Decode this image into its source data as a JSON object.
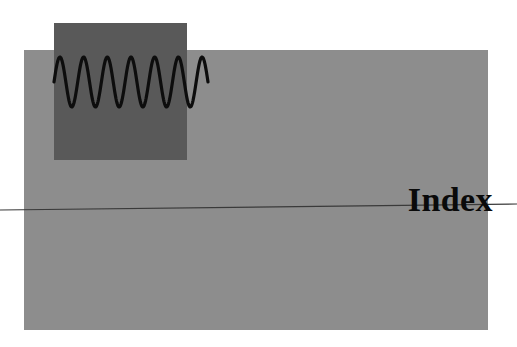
{
  "page": {
    "width": 517,
    "height": 347,
    "background_color": "#ffffff"
  },
  "heading": {
    "text": "Index",
    "color": "#0a0a0a",
    "style": "bold-serif",
    "font_size_px": 34
  },
  "shapes": {
    "background_band": {
      "name": "light-gray-band",
      "color": "#8d8d8d",
      "x": 24,
      "y": 50,
      "width": 464,
      "height": 280
    },
    "overlay_panel": {
      "name": "dark-gray-panel",
      "color": "#595959",
      "x": 54,
      "y": 23,
      "width": 133,
      "height": 137
    },
    "horizontal_rule": {
      "name": "tilted-rule",
      "color": "#3a3a3a",
      "x1": 0,
      "y1": 210,
      "x2": 517,
      "y2": 204,
      "stroke_width": 1.2
    }
  },
  "chart_data": {
    "type": "line",
    "title": "",
    "subtitle": "",
    "xlabel": "",
    "ylabel": "",
    "grid": false,
    "legend": null,
    "stroke_color": "#0d0d0d",
    "stroke_width": 3.2,
    "xlim": [
      54,
      208
    ],
    "ylim": [
      57,
      107
    ],
    "baseline_y": 82,
    "amplitude": 25,
    "cycles": 6.5,
    "wavelength_px": 23.7,
    "x": [
      54,
      58,
      62,
      66,
      70,
      74,
      78,
      82,
      86,
      90,
      94,
      98,
      102,
      106,
      110,
      114,
      118,
      122,
      126,
      130,
      134,
      138,
      142,
      146,
      150,
      154,
      158,
      162,
      166,
      170,
      174,
      178,
      182,
      186,
      190,
      194,
      198,
      202,
      206,
      208
    ],
    "values": [
      82,
      57.2,
      66.2,
      97.5,
      106.9,
      87.8,
      61.0,
      60.3,
      87.1,
      106.8,
      98.1,
      67.0,
      57.1,
      81.2,
      104.3,
      103.3,
      76.0,
      58.2,
      68.0,
      98.5,
      106.5,
      86.0,
      60.2,
      61.0,
      88.1,
      106.9,
      97.0,
      65.5,
      57.0,
      82.4,
      104.8,
      102.6,
      74.6,
      57.9,
      69.1,
      99.3,
      106.3,
      85.0,
      59.8,
      62.0
    ]
  }
}
